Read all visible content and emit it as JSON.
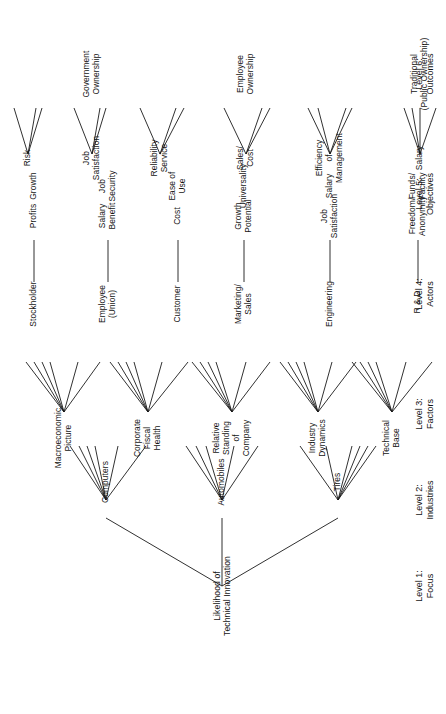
{
  "figure": {
    "root": "Likelihood of Technical Innovation",
    "orientation": "rotated-90-ccw",
    "ink_color": "#141414",
    "background_color": "#ffffff"
  },
  "level_labels": [
    {
      "id": "level-1",
      "text": "Level 1:\nFocus"
    },
    {
      "id": "level-2",
      "text": "Level 2:\nIndustries"
    },
    {
      "id": "level-3",
      "text": "Level 3:\nFactors"
    },
    {
      "id": "level-4",
      "text": "Level 4:\nActors"
    },
    {
      "id": "level-5",
      "text": "Level 5:\nObjectives"
    },
    {
      "id": "level-6",
      "text": "Level 6:\nOutcomes"
    }
  ],
  "level_2_industries": [
    {
      "id": "computers",
      "text": "Computers"
    },
    {
      "id": "automobiles",
      "text": "Automobiles"
    },
    {
      "id": "tires",
      "text": "Tires"
    }
  ],
  "level_3_factors": [
    {
      "id": "technical-base",
      "text": "Technical\nBase"
    },
    {
      "id": "industry-dynamics",
      "text": "Industry\nDynamics"
    },
    {
      "id": "relative-standing",
      "text": "Relative\nStanding\nof\nCompany"
    },
    {
      "id": "corporate-fiscal-health",
      "text": "Corporate\nFiscal\nHealth"
    },
    {
      "id": "macroeconomic-picture",
      "text": "Macroeconomic\nPicture"
    }
  ],
  "level_4_actors": [
    {
      "id": "r-and-d",
      "text": "R & D"
    },
    {
      "id": "engineering",
      "text": "Engineering"
    },
    {
      "id": "marketing-sales",
      "text": "Marketing/\nSales"
    },
    {
      "id": "customer",
      "text": "Customer"
    },
    {
      "id": "employee-union",
      "text": "Employee\n(Union)"
    },
    {
      "id": "stockholder",
      "text": "Stockholder"
    }
  ],
  "level_5_objectives": {
    "r-and-d": [
      {
        "id": "freedom-anonymity",
        "text": "Freedom/\nAnonymity"
      },
      {
        "id": "funds-facility",
        "text": "Funds/\nFacility"
      },
      {
        "id": "salary-rd",
        "text": "Salary"
      }
    ],
    "engineering": [
      {
        "id": "job-satisfaction-eng",
        "text": "Job\nSatisfaction"
      },
      {
        "id": "salary-eng",
        "text": "Salary"
      },
      {
        "id": "efficiency-of-management",
        "text": "Efficiency\nof\nManagement"
      }
    ],
    "marketing-sales": [
      {
        "id": "growth-potential",
        "text": "Growth\nPotential"
      },
      {
        "id": "universality",
        "text": "Universality"
      },
      {
        "id": "sales-cost",
        "text": "Sales/\nCost"
      }
    ],
    "customer": [
      {
        "id": "cost",
        "text": "Cost"
      },
      {
        "id": "ease-of-use",
        "text": "Ease of\nUse"
      },
      {
        "id": "reliability-service",
        "text": "Reliability\nService"
      }
    ],
    "employee-union": [
      {
        "id": "salary-benefit",
        "text": "Salary\nBenefit"
      },
      {
        "id": "job-security",
        "text": "Job\nSecurity"
      },
      {
        "id": "job-satisfaction-emp",
        "text": "Job\nSatisfaction"
      }
    ],
    "stockholder": [
      {
        "id": "profits",
        "text": "Profits"
      },
      {
        "id": "growth",
        "text": "Growth"
      },
      {
        "id": "risk",
        "text": "Risk"
      }
    ]
  },
  "level_6_outcomes": [
    {
      "id": "traditional-public-ownership",
      "text": "Traditional\n(Public Ownership)"
    },
    {
      "id": "employee-ownership",
      "text": "Employee\nOwnership"
    },
    {
      "id": "government-ownership",
      "text": "Government\nOwnership"
    }
  ]
}
